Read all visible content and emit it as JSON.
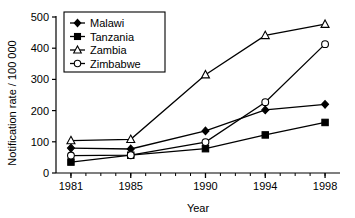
{
  "chart_data": {
    "type": "line",
    "title": "",
    "xlabel": "Year",
    "ylabel": "Notification rate / 100 000",
    "x": [
      1981,
      1985,
      1990,
      1994,
      1998
    ],
    "categories": [
      "1981",
      "1985",
      "1990",
      "1994",
      "1998"
    ],
    "xlim": [
      1980,
      1999
    ],
    "ylim": [
      0,
      500
    ],
    "yticks": [
      0,
      100,
      200,
      300,
      400,
      500
    ],
    "ytick_labels": [
      "0",
      "100",
      "200",
      "300",
      "400",
      "500"
    ],
    "xticks": [
      1981,
      1985,
      1990,
      1994,
      1998
    ],
    "xtick_labels": [
      "1981",
      "1985",
      "1990",
      "1994",
      "1998"
    ],
    "x_minor_ticks": true,
    "grid": false,
    "legend_position": "upper left",
    "series": [
      {
        "name": "Malawi",
        "marker": "filled-diamond",
        "values": [
          80,
          77,
          135,
          202,
          220
        ]
      },
      {
        "name": "Tanzania",
        "marker": "filled-square",
        "values": [
          35,
          57,
          78,
          122,
          162
        ]
      },
      {
        "name": "Zambia",
        "marker": "open-triangle",
        "values": [
          104,
          108,
          315,
          441,
          477
        ]
      },
      {
        "name": "Zimbabwe",
        "marker": "open-circle",
        "values": [
          56,
          57,
          99,
          227,
          413
        ]
      }
    ],
    "line_color": "#000000",
    "background_color": "#ffffff"
  },
  "legend": {
    "items": [
      {
        "label": "Malawi"
      },
      {
        "label": "Tanzania"
      },
      {
        "label": "Zambia"
      },
      {
        "label": "Zimbabwe"
      }
    ]
  }
}
